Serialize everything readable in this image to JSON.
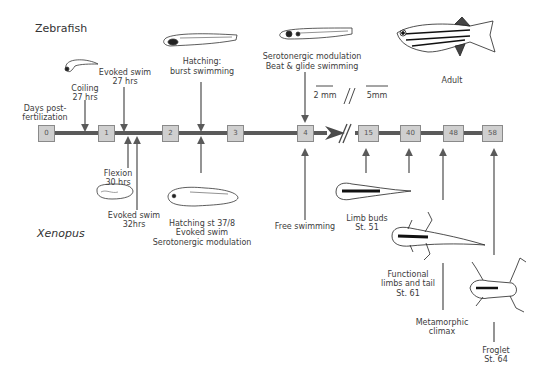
{
  "species": {
    "top": "Zebrafish",
    "bottom": "Xenopus"
  },
  "axis": {
    "label": "Days post-\nfertilization",
    "label_lines": [
      "Days post-",
      "fertilization"
    ],
    "ticks": [
      "0",
      "1",
      "2",
      "3",
      "4",
      "15",
      "40",
      "48",
      "58"
    ],
    "break_symbol": "//",
    "colors": {
      "line": "#5a5a5a",
      "box_fill": "#cfcfcf",
      "box_border": "#8a8a8a",
      "arrow": "#5a5a5a"
    }
  },
  "scale": {
    "left": "2 mm",
    "right": "5mm"
  },
  "zebrafish_events": [
    {
      "lines": [
        "Coiling",
        "27 hrs"
      ]
    },
    {
      "lines": [
        "Evoked swim",
        "27 hrs"
      ]
    },
    {
      "lines": [
        "Hatching:",
        "burst swimming"
      ]
    },
    {
      "lines": [
        "Serotonergic modulation",
        "Beat & glide swimming"
      ]
    },
    {
      "lines": [
        "Adult"
      ]
    }
  ],
  "xenopus_events": [
    {
      "lines": [
        "Flexion",
        "30 hrs"
      ]
    },
    {
      "lines": [
        "Evoked swim",
        "32hrs"
      ]
    },
    {
      "lines": [
        "Hatching st 37/8",
        "Evoked swim",
        "Serotonergic modulation"
      ]
    },
    {
      "lines": [
        "Free swimming"
      ]
    },
    {
      "lines": [
        "Limb buds",
        "St. 51"
      ]
    },
    {
      "lines": [
        "Functional",
        "limbs and tail",
        "St. 61"
      ]
    },
    {
      "lines": [
        "Metamorphic",
        "climax"
      ]
    },
    {
      "lines": [
        "Froglet",
        "St. 64"
      ]
    }
  ],
  "illustrations": [
    "zebrafish-embryo-coiling",
    "zebrafish-larva-hatching",
    "zebrafish-larva-day4",
    "zebrafish-adult",
    "xenopus-embryo-flexion",
    "xenopus-tadpole-hatching",
    "xenopus-tadpole-limb-buds",
    "xenopus-tadpole-functional-limbs",
    "xenopus-froglet"
  ]
}
